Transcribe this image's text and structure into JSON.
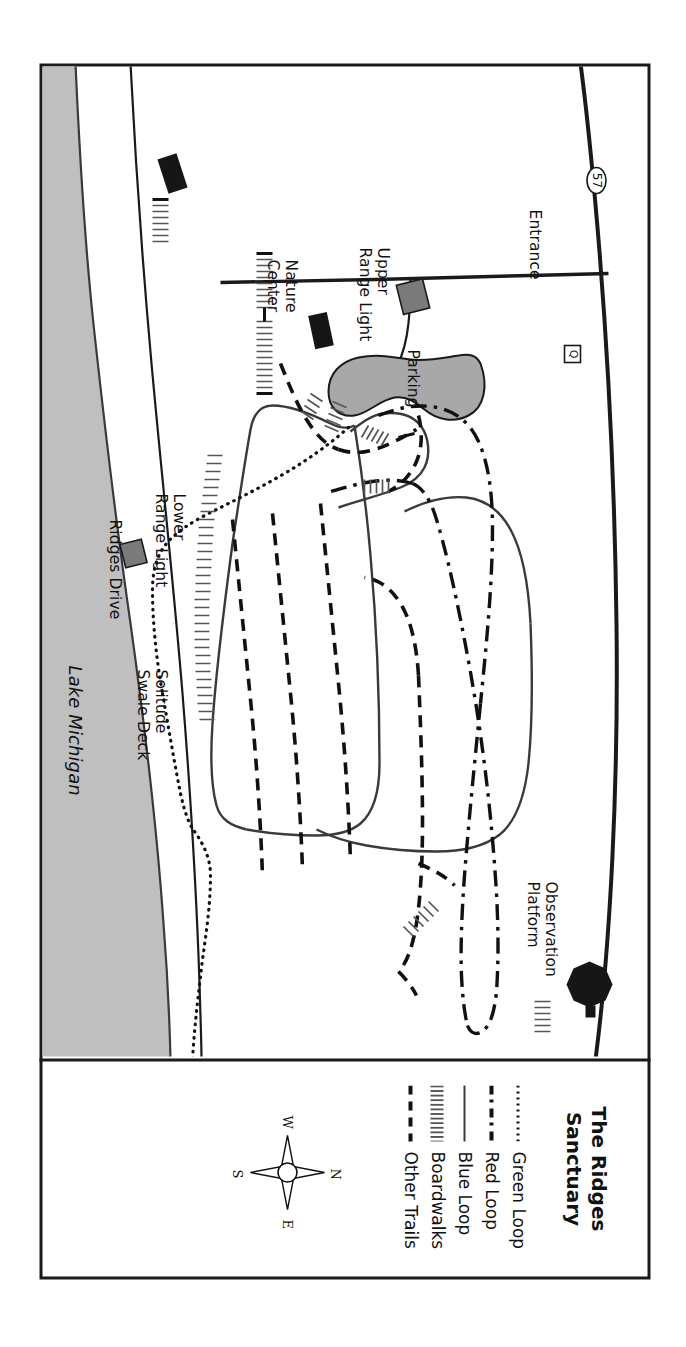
{
  "figure": {
    "kind": "trail-map",
    "orientation_note": "map rendered rotated 90 degrees clockwise on the page"
  },
  "legend": {
    "title_line1": "The Ridges",
    "title_line2": "Sanctuary",
    "items": [
      {
        "label": "Green Loop",
        "style": "dotted"
      },
      {
        "label": "Red Loop",
        "style": "dashdot"
      },
      {
        "label": "Blue Loop",
        "style": "solid"
      },
      {
        "label": "Boardwalks",
        "style": "ladder"
      },
      {
        "label": "Other Trails",
        "style": "dashed"
      }
    ],
    "compass": {
      "name": "compass-rose",
      "north": "N",
      "east": "E",
      "south": "S",
      "west": "W"
    }
  },
  "map_labels": {
    "entrance": "Entrance",
    "parking": "Parking",
    "nature_center_line1": "Nature",
    "nature_center_line2": "Center",
    "upper_range_light_line1": "Upper",
    "upper_range_light_line2": "Range Light",
    "lower_range_light_line1": "Lower",
    "lower_range_light_line2": "Range Light",
    "observation_platform_line1": "Observation",
    "observation_platform_line2": "Platform",
    "solitude_swale_deck_line1": "Solitude",
    "solitude_swale_deck_line2": "Swale Deck",
    "ridges_drive": "Ridges Drive",
    "lake_michigan": "Lake Michigan",
    "highway_shield_57": "57",
    "county_shield_q": "Q"
  },
  "colors": {
    "ink": "#1a1a1a",
    "trail_line": "#3a3a3a",
    "water_fill": "#bfbfbf",
    "parking_fill": "#a8a8a8",
    "building_fill": "#161616",
    "range_light_fill": "#7a7a7a",
    "paper": "#ffffff"
  }
}
